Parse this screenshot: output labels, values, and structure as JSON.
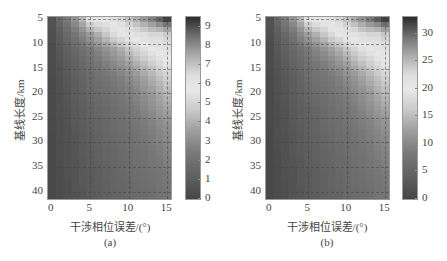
{
  "figure": {
    "panels": [
      {
        "id": "a",
        "caption": "(a)",
        "ylabel": "基线长度/km",
        "xlabel": "干涉相位误差/(°)",
        "xticks": [
          "0",
          "5",
          "10",
          "15"
        ],
        "yticks": [
          "5",
          "10",
          "15",
          "20",
          "25",
          "30",
          "35",
          "40"
        ],
        "colorbar_ticks": [
          "0",
          "1",
          "2",
          "3",
          "4",
          "5",
          "6",
          "7",
          "8",
          "9"
        ],
        "colorbar_range": [
          0,
          9.5
        ]
      },
      {
        "id": "b",
        "caption": "(b)",
        "ylabel": "基线长度/km",
        "xlabel": "干涉相位误差/(°)",
        "xticks": [
          "0",
          "5",
          "10",
          "15"
        ],
        "yticks": [
          "5",
          "10",
          "15",
          "20",
          "25",
          "30",
          "35",
          "40"
        ],
        "colorbar_ticks": [
          "0",
          "5",
          "10",
          "15",
          "20",
          "25",
          "30"
        ],
        "colorbar_range": [
          0,
          33
        ]
      }
    ]
  },
  "chart_data": [
    {
      "type": "heatmap",
      "title": "(a)",
      "xlabel": "干涉相位误差/(°)",
      "ylabel": "基线长度/km",
      "x": [
        0,
        1,
        2,
        3,
        4,
        5,
        6,
        7,
        8,
        9,
        10,
        11,
        12,
        13,
        14,
        15
      ],
      "y": [
        5,
        8,
        11,
        14,
        17,
        20,
        23,
        26,
        29,
        32,
        35,
        38,
        41
      ],
      "xlim": [
        -0.5,
        15.5
      ],
      "ylim": [
        4.5,
        41.5
      ],
      "colorbar": {
        "min": 0,
        "max": 9.5,
        "ticks": [
          0,
          1,
          2,
          3,
          4,
          5,
          6,
          7,
          8,
          9
        ]
      },
      "colormap": "jet (grayscale print)",
      "grid": true,
      "values": [
        [
          0.6,
          1.6,
          2.4,
          3.2,
          4.2,
          5.4,
          5.8,
          5.8,
          6.2,
          6.6,
          7.0,
          7.4,
          7.8,
          8.2,
          8.7,
          9.2
        ],
        [
          0.4,
          1.0,
          1.6,
          2.2,
          2.8,
          3.4,
          4.0,
          4.6,
          5.2,
          5.6,
          6.0,
          6.2,
          6.4,
          6.6,
          6.6,
          6.8
        ],
        [
          0.3,
          0.8,
          1.2,
          1.6,
          2.0,
          2.4,
          2.8,
          3.2,
          3.6,
          4.0,
          4.6,
          5.0,
          5.4,
          5.8,
          6.0,
          6.2
        ],
        [
          0.3,
          0.6,
          1.0,
          1.3,
          1.6,
          2.0,
          2.3,
          2.6,
          2.9,
          3.2,
          3.6,
          4.0,
          4.4,
          4.8,
          5.2,
          5.6
        ],
        [
          0.2,
          0.5,
          0.8,
          1.1,
          1.4,
          1.7,
          2.0,
          2.2,
          2.4,
          2.6,
          2.9,
          3.2,
          3.6,
          4.0,
          4.4,
          4.8
        ],
        [
          0.2,
          0.5,
          0.7,
          1.0,
          1.2,
          1.5,
          1.7,
          1.9,
          2.1,
          2.3,
          2.5,
          2.8,
          3.1,
          3.4,
          3.8,
          4.2
        ],
        [
          0.2,
          0.4,
          0.6,
          0.9,
          1.1,
          1.3,
          1.5,
          1.7,
          1.9,
          2.1,
          2.3,
          2.5,
          2.8,
          3.1,
          3.4,
          3.7
        ],
        [
          0.2,
          0.4,
          0.6,
          0.8,
          1.0,
          1.2,
          1.4,
          1.6,
          1.8,
          1.9,
          2.1,
          2.3,
          2.5,
          2.7,
          3.0,
          3.2
        ],
        [
          0.1,
          0.4,
          0.5,
          0.7,
          0.9,
          1.1,
          1.3,
          1.5,
          1.6,
          1.8,
          1.9,
          2.1,
          2.3,
          2.5,
          2.7,
          2.9
        ],
        [
          0.1,
          0.3,
          0.5,
          0.7,
          0.9,
          1.0,
          1.2,
          1.4,
          1.5,
          1.7,
          1.8,
          2.0,
          2.1,
          2.3,
          2.5,
          2.7
        ],
        [
          0.1,
          0.3,
          0.5,
          0.6,
          0.8,
          1.0,
          1.1,
          1.3,
          1.4,
          1.6,
          1.7,
          1.9,
          2.0,
          2.2,
          2.3,
          2.5
        ],
        [
          0.1,
          0.3,
          0.4,
          0.6,
          0.8,
          0.9,
          1.1,
          1.2,
          1.4,
          1.5,
          1.6,
          1.8,
          1.9,
          2.0,
          2.2,
          2.3
        ],
        [
          0.1,
          0.3,
          0.4,
          0.6,
          0.7,
          0.9,
          1.0,
          1.2,
          1.3,
          1.4,
          1.6,
          1.7,
          1.8,
          1.9,
          2.1,
          2.2
        ]
      ]
    },
    {
      "type": "heatmap",
      "title": "(b)",
      "xlabel": "干涉相位误差/(°)",
      "ylabel": "基线长度/km",
      "x": [
        0,
        1,
        2,
        3,
        4,
        5,
        6,
        7,
        8,
        9,
        10,
        11,
        12,
        13,
        14,
        15
      ],
      "y": [
        5,
        8,
        11,
        14,
        17,
        20,
        23,
        26,
        29,
        32,
        35,
        38,
        41
      ],
      "xlim": [
        -0.5,
        15.5
      ],
      "ylim": [
        4.5,
        41.5
      ],
      "colorbar": {
        "min": 0,
        "max": 33,
        "ticks": [
          0,
          5,
          10,
          15,
          20,
          25,
          30
        ]
      },
      "colormap": "jet (grayscale print)",
      "grid": true,
      "values": [
        [
          2,
          5.5,
          8.5,
          11,
          14.5,
          19,
          20.5,
          20.5,
          22,
          23,
          24.5,
          26,
          27.5,
          29,
          30.5,
          32
        ],
        [
          1.5,
          3.5,
          5.5,
          7.5,
          10,
          12,
          14,
          16,
          18,
          19.5,
          21,
          21.5,
          22.5,
          23,
          23,
          24
        ],
        [
          1,
          2.8,
          4.2,
          5.6,
          7,
          8.4,
          9.8,
          11.2,
          12.6,
          14,
          16,
          17.5,
          19,
          20,
          21,
          21.5
        ],
        [
          1,
          2.1,
          3.5,
          4.5,
          5.6,
          7,
          8,
          9,
          10,
          11.2,
          12.6,
          14,
          15.4,
          16.8,
          18.2,
          19.6
        ],
        [
          0.7,
          1.8,
          2.8,
          3.8,
          4.9,
          6,
          7,
          7.7,
          8.4,
          9.1,
          10.2,
          11.2,
          12.6,
          14,
          15.4,
          16.8
        ],
        [
          0.7,
          1.8,
          2.5,
          3.5,
          4.2,
          5.2,
          6,
          6.6,
          7.4,
          8,
          8.8,
          9.8,
          10.8,
          11.9,
          13.3,
          14.7
        ],
        [
          0.7,
          1.4,
          2.1,
          3.1,
          3.8,
          4.5,
          5.2,
          6,
          6.6,
          7.4,
          8,
          8.8,
          9.8,
          10.8,
          11.9,
          13
        ],
        [
          0.7,
          1.4,
          2.1,
          2.8,
          3.5,
          4.2,
          4.9,
          5.6,
          6.3,
          6.6,
          7.4,
          8,
          8.8,
          9.4,
          10.5,
          11.2
        ],
        [
          0.4,
          1.4,
          1.8,
          2.5,
          3.1,
          3.8,
          4.5,
          5.2,
          5.6,
          6.3,
          6.6,
          7.4,
          8,
          8.8,
          9.4,
          10.2
        ],
        [
          0.4,
          1,
          1.8,
          2.5,
          3.1,
          3.5,
          4.2,
          4.9,
          5.2,
          6,
          6.3,
          7,
          7.4,
          8,
          8.8,
          9.4
        ],
        [
          0.4,
          1,
          1.8,
          2.1,
          2.8,
          3.5,
          3.8,
          4.5,
          4.9,
          5.6,
          6,
          6.6,
          7,
          7.7,
          8,
          8.8
        ],
        [
          0.4,
          1,
          1.4,
          2.1,
          2.8,
          3.1,
          3.8,
          4.2,
          4.9,
          5.2,
          5.6,
          6.3,
          6.6,
          7,
          7.7,
          8
        ],
        [
          0.4,
          1,
          1.4,
          2.1,
          2.5,
          3.1,
          3.5,
          4.2,
          4.5,
          4.9,
          5.6,
          6,
          6.3,
          6.6,
          7.4,
          7.7
        ]
      ]
    }
  ]
}
